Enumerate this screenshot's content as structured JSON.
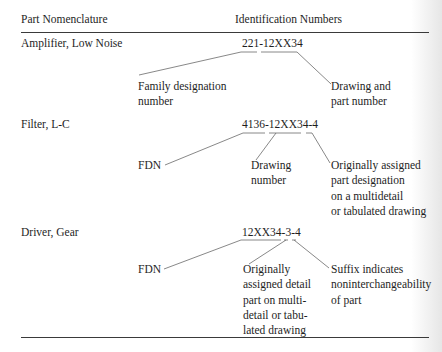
{
  "header": {
    "col1": "Part Nomenclature",
    "col2": "Identification Numbers"
  },
  "rows": [
    {
      "part": "Amplifier, Low Noise",
      "id_number": "221-12XX34",
      "annotations": [
        {
          "lines": [
            "Family designation",
            "number"
          ]
        },
        {
          "lines": [
            "Drawing and",
            "part number"
          ]
        }
      ]
    },
    {
      "part": "Filter, L-C",
      "id_number": "4136-12XX34-4",
      "annotations": [
        {
          "lines": [
            "FDN"
          ]
        },
        {
          "lines": [
            "Drawing",
            "number"
          ]
        },
        {
          "lines": [
            "Originally assigned",
            "part designation",
            "on a multidetail",
            "or tabulated drawing"
          ]
        }
      ]
    },
    {
      "part": "Driver, Gear",
      "id_number": "12XX34-3-4",
      "annotations": [
        {
          "lines": [
            "FDN"
          ]
        },
        {
          "lines": [
            "Originally",
            "assigned detail",
            "part on multi-",
            "detail or tabu-",
            "lated drawing"
          ]
        },
        {
          "lines": [
            "Suffix indicates",
            "noninterchangeability",
            "of part"
          ]
        }
      ]
    }
  ]
}
